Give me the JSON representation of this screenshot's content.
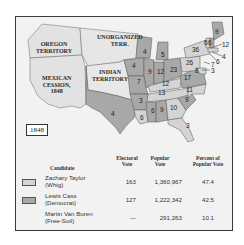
{
  "map": {
    "year": "1848",
    "region_labels": [
      {
        "id": "oregon",
        "text": "OREGON\nTERRITORY"
      },
      {
        "id": "unorganized",
        "text": "UNORGANIZED\nTERR."
      },
      {
        "id": "mexican",
        "text": "MEXICAN\nCESSION,\n1848"
      },
      {
        "id": "indian",
        "text": "INDIAN\nTERRITORY"
      }
    ],
    "electoral_votes": [
      {
        "state": "Texas",
        "votes": "4",
        "party": "Democrat"
      },
      {
        "state": "Wisconsin",
        "votes": "4",
        "party": "Democrat"
      },
      {
        "state": "Michigan",
        "votes": "5",
        "party": "Democrat"
      },
      {
        "state": "Iowa",
        "votes": "4",
        "party": "Democrat"
      },
      {
        "state": "Illinois",
        "votes": "9",
        "party": "Democrat"
      },
      {
        "state": "Indiana",
        "votes": "12",
        "party": "Democrat"
      },
      {
        "state": "Ohio",
        "votes": "23",
        "party": "Democrat"
      },
      {
        "state": "Missouri",
        "votes": "7",
        "party": "Democrat"
      },
      {
        "state": "Kentucky",
        "votes": "12",
        "party": "Whig"
      },
      {
        "state": "Tennessee",
        "votes": "13",
        "party": "Whig"
      },
      {
        "state": "Arkansas",
        "votes": "3",
        "party": "Democrat"
      },
      {
        "state": "Mississippi",
        "votes": "6",
        "party": "Democrat"
      },
      {
        "state": "Alabama",
        "votes": "9",
        "party": "Democrat"
      },
      {
        "state": "Georgia",
        "votes": "10",
        "party": "Whig"
      },
      {
        "state": "Louisiana",
        "votes": "6",
        "party": "Whig"
      },
      {
        "state": "Florida",
        "votes": "3",
        "party": "Whig"
      },
      {
        "state": "South Carolina",
        "votes": "9",
        "party": "Democrat"
      },
      {
        "state": "North Carolina",
        "votes": "11",
        "party": "Whig"
      },
      {
        "state": "Virginia",
        "votes": "17",
        "party": "Democrat"
      },
      {
        "state": "Pennsylvania",
        "votes": "26",
        "party": "Whig"
      },
      {
        "state": "Maryland",
        "votes": "8",
        "party": "Whig"
      },
      {
        "state": "Delaware",
        "votes": "3",
        "party": "Whig"
      },
      {
        "state": "New Jersey",
        "votes": "7",
        "party": "Whig"
      },
      {
        "state": "New York",
        "votes": "36",
        "party": "Whig"
      },
      {
        "state": "Vermont",
        "votes": "6",
        "party": "Whig"
      },
      {
        "state": "New Hampshire",
        "votes": "6",
        "party": "Democrat"
      },
      {
        "state": "Maine",
        "votes": "9",
        "party": "Democrat"
      },
      {
        "state": "Massachusetts",
        "votes": "12",
        "party": "Whig"
      },
      {
        "state": "Rhode Island",
        "votes": "4",
        "party": "Whig"
      },
      {
        "state": "Connecticut",
        "votes": "6",
        "party": "Whig"
      }
    ]
  },
  "table": {
    "headers": {
      "candidate": "Candidate",
      "electoral": "Electoral\nVote",
      "popular": "Popular\nVote",
      "percent": "Percent of\nPopular Vote"
    },
    "rows": [
      {
        "name": "Zachary Taylor",
        "party": "(Whig)",
        "electoral": "163",
        "popular": "1,360,967",
        "percent": "47.4",
        "swatch": "#d4d4d4"
      },
      {
        "name": "Lewis Cass",
        "party": "(Democrat)",
        "electoral": "127",
        "popular": "1,222,342",
        "percent": "42.5",
        "swatch": "#a8a8a8"
      },
      {
        "name": "Martin Van Buren",
        "party": "(Free-Soil)",
        "electoral": "—",
        "popular": "291,263",
        "percent": "10.1",
        "swatch": ""
      }
    ]
  },
  "colors": {
    "whig": "#d4d4d4",
    "democrat": "#a8a8a8",
    "territory": "#e6e6e6",
    "background": "#f2f2f2",
    "border": "#3a3a3a"
  }
}
